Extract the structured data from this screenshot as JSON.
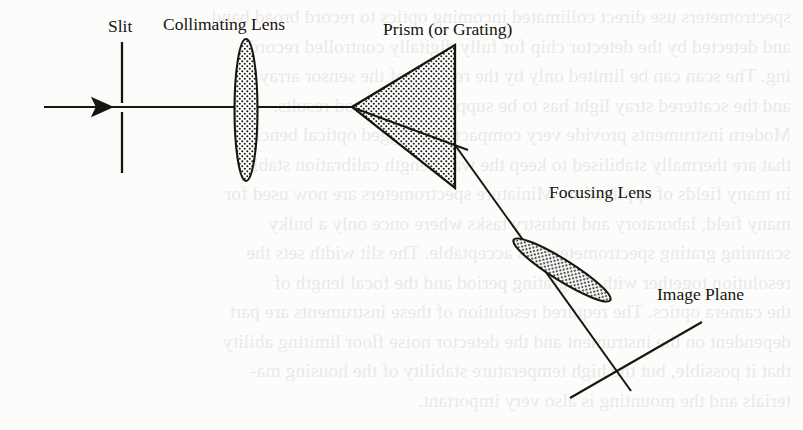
{
  "figure": {
    "kind": "optical-ray-diagram",
    "background_color": "#fcfcfb",
    "ink_color": "#17150f"
  },
  "labels": {
    "slit": "Slit",
    "collimating_lens": "Collimating Lens",
    "prism": "Prism (or Grating)",
    "focusing_lens": "Focusing Lens",
    "image_plane": "Image Plane"
  },
  "components": {
    "input_arrow": {
      "icon": "right-arrow-icon"
    },
    "optical_axis": {
      "icon": "ray-line-icon"
    },
    "slit_aperture": {
      "icon": "slit-icon"
    },
    "collimating_lens_body": {
      "icon": "biconvex-lens-icon"
    },
    "prism_body": {
      "icon": "triangle-prism-icon"
    },
    "refracted_ray": {
      "icon": "ray-line-icon"
    },
    "focusing_lens_body": {
      "icon": "biconvex-lens-icon"
    },
    "image_plane_line": {
      "icon": "plane-line-icon"
    }
  },
  "ghost_text": {
    "lines": [
      "spectrometers use direct collimated incoming optics to record broad band",
      "and detected by the detector chip for fully digitally controlled record-",
      "ing. The scan can be limited only by the readout of the sensor array",
      "and the scattered stray light has to be suppressed for good results.",
      "Modern instruments provide very compact and rugged optical benches",
      "that are thermally stabilised to keep the wavelength calibration stable",
      "in many fields of application. Miniature spectrometers are now used for",
      "many field, laboratory and industry tasks where once only a bulky",
      "scanning grating spectrometer was acceptable. The slit width sets the",
      "resolution together with the grating period and the focal length of",
      "the camera optics. The required resolution of these instruments are part",
      "dependent on the instrument and the detector noise floor limiting ability",
      "that it possible, but the high temperature stability of the housing ma-",
      "terials and the mounting is also very important."
    ]
  }
}
